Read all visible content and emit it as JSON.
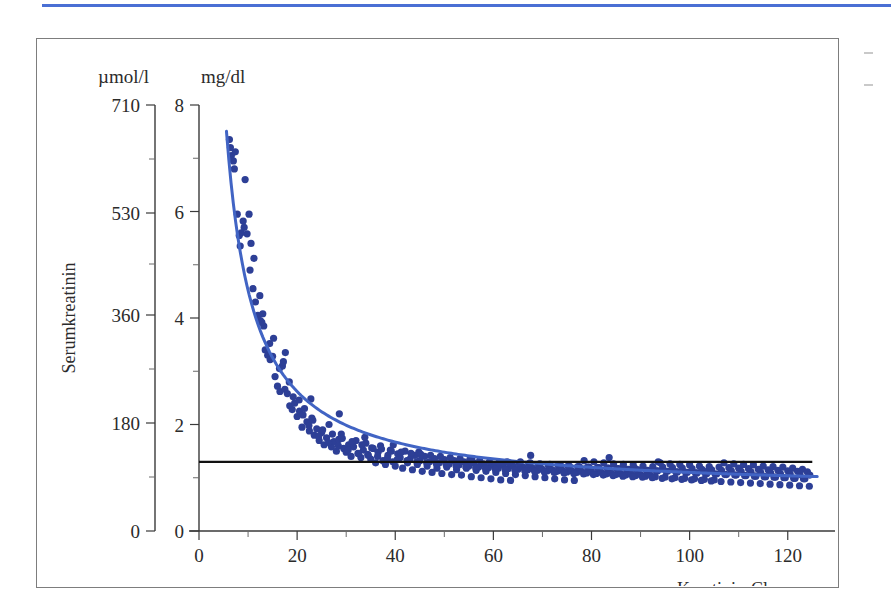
{
  "page": {
    "top_rule_color": "#4a6fd4",
    "frame_border_color": "#7d7d7d",
    "background": "#ffffff"
  },
  "chart_data": {
    "type": "scatter",
    "title": "",
    "subtitle": "",
    "xlabel": "Kreatinin-Clearance",
    "ylabel": "Serumkreatinin",
    "y_unit_primary": "mg/dl",
    "y_unit_secondary": "µmol/l",
    "xlim": [
      0,
      128
    ],
    "ylim": [
      0,
      8
    ],
    "ylim_secondary": [
      0,
      710
    ],
    "grid": false,
    "legend": null,
    "point_color": "#2d3f96",
    "curve_color": "#4164c4",
    "reference_line_color": "#111111",
    "xticks": [
      0,
      20,
      40,
      60,
      80,
      100,
      120
    ],
    "xticklabels": [
      "0",
      "20",
      "40",
      "60",
      "80",
      "100",
      "120"
    ],
    "xticks_minor": [
      10,
      30,
      50,
      70,
      90,
      110
    ],
    "yticks": [
      0,
      2,
      4,
      6,
      8
    ],
    "yticklabels": [
      "0",
      "2",
      "4",
      "6",
      "8"
    ],
    "yticks_minor": [
      1,
      3,
      5,
      7
    ],
    "yticks_secondary": [
      0,
      180,
      360,
      530,
      710
    ],
    "yticklabels_secondary": [
      "0",
      "180",
      "360",
      "530",
      "710"
    ],
    "reference_line": {
      "label": "Normalgrenze Serumkreatinin",
      "y_value": 1.3,
      "x_start": 0,
      "x_end": 125
    },
    "fit_curve": {
      "label": "hyperbolische Regression",
      "form": "y = a / x + b",
      "a": 38.0,
      "b": 0.72,
      "x_start": 5.6,
      "x_end": 126
    },
    "series": [
      {
        "name": "Patienten",
        "n_points": 382,
        "x": [
          6.2,
          6.6,
          7.0,
          7.4,
          7.8,
          8.2,
          8.6,
          9.0,
          9.4,
          9.8,
          10.2,
          10.6,
          11.0,
          11.5,
          12.0,
          12.5,
          13.0,
          13.5,
          14.0,
          14.5,
          15.0,
          15.5,
          16.0,
          16.5,
          17.0,
          17.5,
          18.0,
          18.5,
          19.0,
          19.5,
          20.0,
          20.5,
          21.0,
          21.5,
          22.0,
          22.5,
          23.0,
          23.5,
          24.0,
          24.5,
          25.0,
          25.5,
          26.0,
          26.5,
          27.0,
          27.5,
          28.0,
          28.5,
          29.0,
          29.5,
          30.0,
          30.5,
          31.0,
          31.5,
          32.0,
          32.5,
          33.0,
          33.5,
          34.0,
          34.5,
          35.0,
          35.5,
          36.0,
          36.5,
          37.0,
          37.5,
          38.0,
          38.5,
          39.0,
          39.5,
          40.0,
          40.5,
          41.0,
          41.5,
          42.0,
          42.5,
          43.0,
          43.5,
          44.0,
          44.5,
          45.0,
          45.5,
          46.0,
          46.5,
          47.0,
          47.5,
          48.0,
          48.5,
          49.0,
          49.5,
          50.0,
          50.5,
          51.0,
          51.5,
          52.0,
          52.5,
          53.0,
          53.5,
          54.0,
          54.5,
          55.0,
          55.5,
          56.0,
          56.5,
          57.0,
          57.5,
          58.0,
          58.5,
          59.0,
          59.5,
          60.0,
          60.5,
          61.0,
          61.5,
          62.0,
          62.5,
          63.0,
          63.5,
          64.0,
          64.5,
          65.0,
          65.5,
          66.0,
          66.5,
          67.0,
          67.5,
          68.0,
          68.5,
          69.0,
          69.5,
          70.0,
          70.5,
          71.0,
          71.5,
          72.0,
          72.5,
          73.0,
          73.5,
          74.0,
          74.5,
          75.0,
          75.5,
          76.0,
          76.5,
          77.0,
          77.5,
          78.0,
          78.5,
          79.0,
          79.5,
          80.0,
          80.5,
          81.0,
          81.5,
          82.0,
          82.5,
          83.0,
          83.5,
          84.0,
          84.5,
          85.0,
          85.5,
          86.0,
          86.5,
          87.0,
          87.5,
          88.0,
          88.5,
          89.0,
          89.5,
          90.0,
          90.5,
          91.0,
          91.5,
          92.0,
          92.5,
          93.0,
          93.5,
          94.0,
          94.5,
          95.0,
          95.5,
          96.0,
          96.5,
          97.0,
          97.5,
          98.0,
          98.5,
          99.0,
          99.5,
          100.0,
          100.5,
          101.0,
          101.5,
          102.0,
          102.5,
          103.0,
          103.5,
          104.0,
          104.5,
          105.0,
          105.5,
          106.0,
          106.5,
          107.0,
          107.5,
          108.0,
          108.5,
          109.0,
          109.5,
          110.0,
          110.5,
          111.0,
          111.5,
          112.0,
          112.5,
          113.0,
          113.5,
          114.0,
          114.5,
          115.0,
          115.5,
          116.0,
          116.5,
          117.0,
          117.5,
          118.0,
          118.5,
          119.0,
          119.5,
          120.0,
          120.5,
          121.0,
          121.5,
          122.0,
          122.5,
          123.0,
          123.5,
          124.0,
          124.5,
          6.4,
          7.2,
          8.4,
          9.2,
          10.4,
          11.2,
          12.4,
          13.2,
          14.4,
          15.2,
          16.4,
          17.2,
          18.4,
          19.2,
          20.4,
          21.2,
          22.4,
          23.2,
          24.4,
          25.2,
          26.4,
          27.2,
          28.4,
          29.2,
          30.4,
          31.2,
          32.4,
          33.2,
          34.4,
          35.2,
          36.4,
          37.2,
          38.4,
          39.2,
          40.4,
          41.2,
          42.4,
          43.2,
          44.4,
          45.2,
          46.4,
          47.2,
          48.4,
          49.2,
          50.4,
          51.2,
          52.4,
          53.2,
          54.4,
          55.2,
          56.4,
          57.2,
          58.4,
          59.2,
          60.4,
          61.2,
          62.4,
          63.2,
          64.4,
          65.2,
          66.4,
          67.2,
          68.4,
          69.2,
          70.4,
          71.2,
          72.4,
          73.2,
          74.4,
          75.2,
          76.4,
          77.2,
          78.4,
          79.2,
          80.4,
          81.2,
          82.4,
          83.2,
          84.4,
          85.2,
          86.4,
          87.2,
          88.4,
          89.2,
          90.4,
          91.2,
          92.4,
          93.2,
          94.4,
          95.2,
          96.4,
          97.2,
          98.4,
          99.2,
          100.4,
          101.2,
          102.4,
          103.2,
          104.4,
          105.2,
          106.4,
          107.2,
          108.4,
          109.2,
          110.4,
          111.2,
          112.4,
          113.2,
          114.4,
          115.2,
          116.4,
          117.2,
          118.4,
          119.2,
          120.4,
          121.2,
          122.4,
          123.2,
          124.4,
          12.8,
          17.6,
          22.8,
          28.6,
          33.8,
          39.6,
          44.8,
          55.6,
          62.8,
          67.6,
          73.8,
          83.6,
          88.8,
          93.6,
          103.8
        ],
        "y": [
          7.35,
          7.05,
          6.95,
          7.12,
          5.95,
          5.55,
          5.6,
          5.82,
          6.6,
          5.58,
          5.95,
          5.4,
          4.55,
          4.3,
          4.05,
          3.95,
          4.08,
          3.4,
          3.3,
          3.22,
          3.28,
          2.9,
          2.72,
          2.62,
          3.1,
          2.66,
          2.58,
          2.35,
          2.28,
          2.4,
          2.15,
          2.25,
          1.95,
          2.3,
          2.05,
          1.88,
          2.12,
          1.8,
          1.92,
          1.7,
          1.85,
          1.62,
          1.75,
          2.0,
          1.58,
          1.68,
          1.5,
          1.72,
          1.82,
          1.55,
          1.48,
          1.62,
          1.4,
          1.58,
          1.7,
          1.45,
          1.38,
          1.52,
          1.65,
          1.42,
          1.35,
          1.55,
          1.28,
          1.48,
          1.6,
          1.32,
          1.25,
          1.42,
          1.52,
          1.3,
          1.22,
          1.45,
          1.38,
          1.18,
          1.5,
          1.28,
          1.35,
          1.15,
          1.42,
          1.25,
          1.32,
          1.12,
          1.4,
          1.22,
          1.3,
          1.1,
          1.36,
          1.18,
          1.28,
          1.08,
          1.34,
          1.2,
          1.26,
          1.06,
          1.32,
          1.15,
          1.24,
          1.05,
          1.3,
          1.18,
          1.22,
          1.02,
          1.28,
          1.14,
          1.2,
          1.0,
          1.26,
          1.12,
          1.19,
          0.98,
          1.25,
          1.1,
          1.18,
          0.96,
          1.24,
          1.08,
          1.17,
          0.95,
          1.22,
          1.06,
          1.16,
          1.3,
          1.2,
          1.04,
          1.15,
          1.28,
          1.18,
          1.02,
          1.14,
          1.26,
          1.16,
          1.0,
          1.13,
          1.25,
          1.15,
          0.98,
          1.12,
          1.24,
          1.14,
          0.96,
          1.11,
          1.22,
          1.13,
          0.95,
          1.1,
          1.21,
          1.12,
          1.32,
          1.09,
          1.2,
          1.11,
          1.3,
          1.08,
          1.19,
          1.1,
          1.28,
          1.07,
          1.18,
          1.09,
          1.26,
          1.06,
          1.17,
          1.08,
          1.25,
          1.05,
          1.16,
          1.07,
          1.24,
          1.04,
          1.15,
          1.06,
          1.22,
          1.03,
          1.14,
          1.05,
          1.21,
          1.02,
          1.13,
          1.28,
          1.2,
          1.01,
          1.12,
          1.26,
          1.19,
          1.0,
          1.11,
          1.25,
          1.18,
          0.99,
          1.1,
          1.24,
          1.17,
          0.98,
          1.09,
          1.22,
          1.16,
          0.97,
          1.08,
          1.21,
          1.15,
          0.96,
          1.07,
          1.2,
          1.14,
          1.28,
          1.06,
          1.19,
          1.13,
          1.26,
          1.05,
          1.18,
          1.12,
          1.25,
          1.04,
          1.17,
          1.11,
          1.24,
          1.03,
          1.16,
          1.1,
          1.22,
          1.02,
          1.15,
          1.09,
          1.21,
          1.01,
          1.14,
          1.08,
          1.2,
          1.0,
          1.13,
          1.07,
          1.18,
          0.99,
          1.12,
          1.06,
          1.16,
          0.98,
          1.11,
          1.05,
          7.2,
          6.8,
          5.35,
          5.7,
          4.9,
          5.12,
          4.42,
          3.85,
          3.52,
          3.62,
          3.05,
          3.18,
          2.8,
          2.52,
          2.46,
          2.18,
          1.98,
          2.08,
          1.78,
          1.9,
          1.66,
          1.82,
          1.6,
          1.74,
          1.52,
          1.68,
          1.46,
          1.62,
          1.44,
          1.56,
          1.4,
          1.54,
          1.36,
          1.5,
          1.34,
          1.48,
          1.32,
          1.46,
          1.3,
          1.44,
          1.28,
          1.42,
          1.26,
          1.4,
          1.24,
          1.38,
          1.22,
          1.36,
          1.2,
          1.34,
          1.19,
          1.32,
          1.17,
          1.3,
          1.16,
          1.29,
          1.15,
          1.28,
          1.14,
          1.27,
          1.13,
          1.26,
          1.12,
          1.25,
          1.11,
          1.24,
          1.1,
          1.23,
          1.09,
          1.22,
          1.08,
          1.21,
          1.07,
          1.2,
          1.06,
          1.19,
          1.05,
          1.18,
          1.04,
          1.17,
          1.03,
          1.16,
          1.02,
          1.15,
          1.01,
          1.14,
          1.0,
          1.13,
          0.99,
          1.12,
          0.98,
          1.11,
          0.97,
          1.1,
          0.96,
          1.09,
          0.95,
          1.08,
          0.94,
          1.07,
          0.93,
          1.06,
          0.92,
          1.05,
          0.91,
          1.04,
          0.9,
          1.03,
          0.89,
          1.02,
          0.88,
          1.01,
          0.87,
          1.0,
          0.86,
          0.99,
          0.85,
          0.98,
          0.84,
          3.92,
          3.35,
          2.48,
          2.2,
          1.76,
          1.62,
          1.48,
          1.36,
          1.3,
          1.42,
          1.22,
          1.38,
          1.18,
          1.3,
          1.14
        ]
      }
    ]
  }
}
